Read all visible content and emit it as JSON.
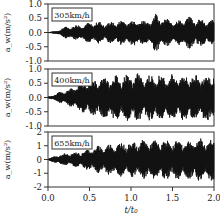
{
  "chart_data": [
    {
      "type": "line",
      "title": "",
      "annotation": "305km/h",
      "xlabel": "t/t0",
      "ylabel": "a_w (m/s^2)",
      "ylim": [
        -1.0,
        1.0
      ],
      "yticks": [
        "1.0",
        "0.5",
        "0.0",
        "-0.5",
        "-1.0"
      ],
      "xlim": [
        0.0,
        2.0
      ],
      "envelope_x": [
        0.0,
        0.1,
        0.2,
        0.3,
        0.4,
        0.5,
        0.6,
        0.7,
        0.8,
        0.9,
        1.0,
        1.1,
        1.2,
        1.3,
        1.4,
        1.5,
        1.6,
        1.7,
        1.8,
        1.9,
        2.0
      ],
      "envelope_amplitude": [
        0.02,
        0.05,
        0.2,
        0.25,
        0.3,
        0.35,
        0.4,
        0.35,
        0.4,
        0.45,
        0.45,
        0.5,
        0.4,
        0.7,
        0.5,
        0.45,
        0.45,
        0.6,
        0.5,
        0.45,
        0.45
      ]
    },
    {
      "type": "line",
      "annotation": "400km/h",
      "xlabel": "t/t0",
      "ylabel": "a_w (m/s^2)",
      "ylim": [
        -1.0,
        1.0
      ],
      "yticks": [
        "1.0",
        "0.5",
        "0.0",
        "-0.5",
        "-1.0"
      ],
      "xlim": [
        0.0,
        2.0
      ],
      "envelope_x": [
        0.0,
        0.1,
        0.2,
        0.3,
        0.4,
        0.5,
        0.6,
        0.7,
        0.8,
        0.9,
        1.0,
        1.1,
        1.2,
        1.3,
        1.4,
        1.5,
        1.6,
        1.7,
        1.8,
        1.9,
        2.0
      ],
      "envelope_amplitude": [
        0.02,
        0.15,
        0.25,
        0.35,
        0.55,
        0.6,
        0.7,
        0.75,
        0.8,
        0.8,
        0.85,
        0.85,
        0.8,
        0.85,
        0.8,
        0.85,
        0.8,
        0.85,
        0.8,
        0.85,
        0.9
      ]
    },
    {
      "type": "line",
      "annotation": "655km/h",
      "xlabel": "t/t0",
      "ylabel": "a_w (m/s^2)",
      "ylim": [
        -2,
        2
      ],
      "yticks": [
        "2",
        "1",
        "0",
        "-1",
        "-2"
      ],
      "xlim": [
        0.0,
        2.0
      ],
      "xticks": [
        "0.0",
        "0.5",
        "1.0",
        "1.5",
        "2.0"
      ],
      "envelope_x": [
        0.0,
        0.1,
        0.2,
        0.3,
        0.4,
        0.5,
        0.6,
        0.7,
        0.8,
        0.9,
        1.0,
        1.1,
        1.2,
        1.3,
        1.4,
        1.5,
        1.6,
        1.7,
        1.8,
        1.9,
        2.0
      ],
      "envelope_amplitude": [
        0.05,
        0.3,
        0.45,
        0.5,
        0.6,
        0.8,
        1.0,
        1.1,
        1.2,
        1.3,
        1.3,
        1.4,
        1.5,
        1.4,
        1.5,
        1.4,
        1.5,
        1.4,
        1.6,
        1.5,
        1.6
      ]
    }
  ],
  "panels": [
    {
      "speed": "305km/h",
      "yticks": [
        "1.0",
        "0.5",
        "0.0",
        "-0.5",
        "-1.0"
      ]
    },
    {
      "speed": "400km/h",
      "yticks": [
        "1.0",
        "0.5",
        "0.0",
        "-0.5",
        "-1.0"
      ]
    },
    {
      "speed": "655km/h",
      "yticks": [
        "2",
        "1",
        "0",
        "-1",
        "-2"
      ]
    }
  ],
  "ylabel": "a_w(m/s²)",
  "xaxis": {
    "ticks": [
      "0.0",
      "0.5",
      "1.0",
      "1.5",
      "2.0"
    ],
    "label": "t/t₀"
  }
}
